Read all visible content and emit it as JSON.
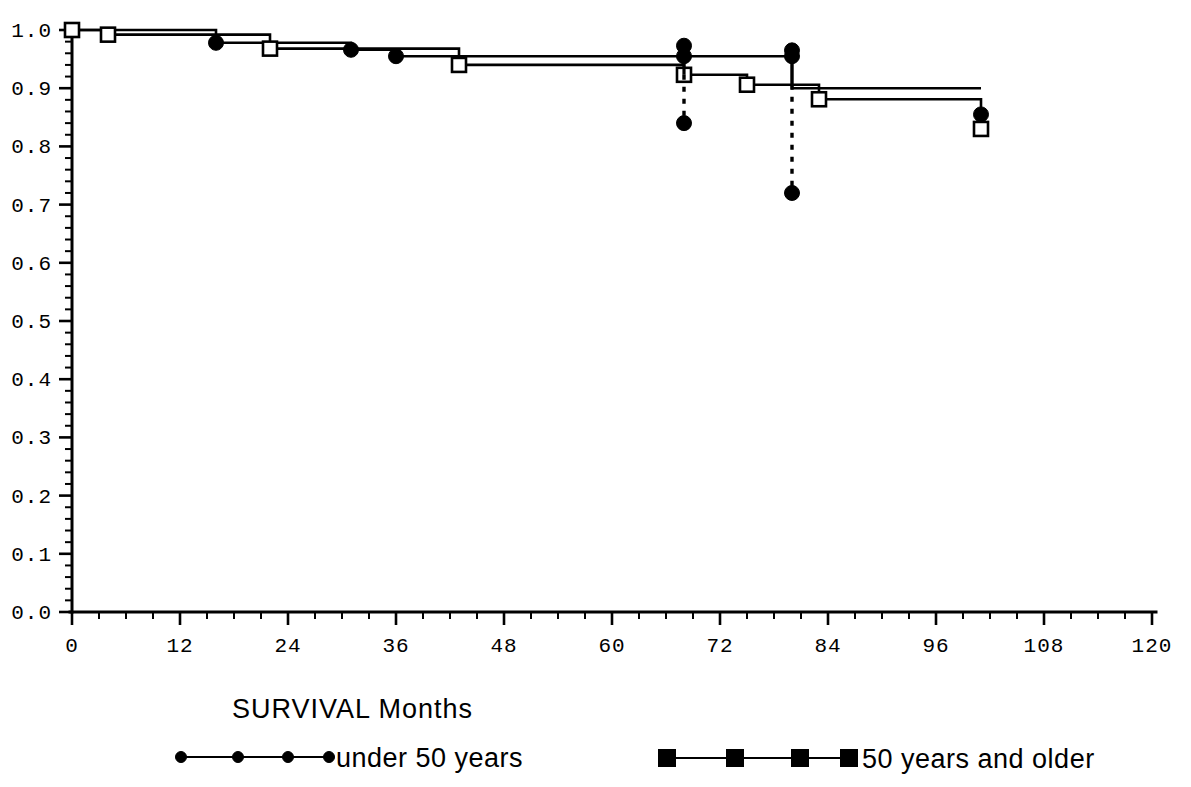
{
  "chart_data": {
    "type": "line",
    "title": "SURVIVAL  Months",
    "xlabel": "",
    "ylabel": "",
    "xlim": [
      0,
      120
    ],
    "ylim": [
      0.0,
      1.0
    ],
    "grid": false,
    "legend_position": "bottom",
    "x_ticks": [
      0,
      12,
      24,
      36,
      48,
      60,
      72,
      84,
      96,
      108,
      120
    ],
    "x_tick_labels": [
      "0",
      "12",
      "24",
      "36",
      "48",
      "60",
      "72",
      "84",
      "96",
      "108",
      "120"
    ],
    "x_minor_interval": 3,
    "y_ticks": [
      0.0,
      0.1,
      0.2,
      0.3,
      0.4,
      0.5,
      0.6,
      0.7,
      0.8,
      0.9,
      1.0
    ],
    "y_tick_labels": [
      "0.0",
      "0.1",
      "0.2",
      "0.3",
      "0.4",
      "0.5",
      "0.6",
      "0.7",
      "0.8",
      "0.9",
      "1.0"
    ],
    "y_minor_interval": 0.02,
    "series": [
      {
        "name": "under 50 years",
        "marker": "filled-circle",
        "steps": [
          {
            "x": 0,
            "y": 1.0
          },
          {
            "x": 16,
            "y": 1.0
          },
          {
            "x": 16,
            "y": 0.978
          },
          {
            "x": 31,
            "y": 0.978
          },
          {
            "x": 31,
            "y": 0.966
          },
          {
            "x": 36,
            "y": 0.966
          },
          {
            "x": 36,
            "y": 0.955
          },
          {
            "x": 68,
            "y": 0.955
          },
          {
            "x": 68,
            "y": 0.955
          },
          {
            "x": 80,
            "y": 0.955
          },
          {
            "x": 80,
            "y": 0.9
          },
          {
            "x": 101,
            "y": 0.9
          }
        ],
        "marker_points": [
          {
            "x": 0,
            "y": 1.0
          },
          {
            "x": 16,
            "y": 0.978
          },
          {
            "x": 31,
            "y": 0.966
          },
          {
            "x": 36,
            "y": 0.955
          },
          {
            "x": 68,
            "y": 0.955
          },
          {
            "x": 80,
            "y": 0.955
          },
          {
            "x": 101,
            "y": 0.855
          }
        ]
      },
      {
        "name": "50 years and older",
        "marker": "open-square",
        "steps": [
          {
            "x": 0,
            "y": 1.0
          },
          {
            "x": 4,
            "y": 1.0
          },
          {
            "x": 4,
            "y": 0.992
          },
          {
            "x": 22,
            "y": 0.992
          },
          {
            "x": 22,
            "y": 0.968
          },
          {
            "x": 43,
            "y": 0.968
          },
          {
            "x": 43,
            "y": 0.94
          },
          {
            "x": 68,
            "y": 0.94
          },
          {
            "x": 68,
            "y": 0.923
          },
          {
            "x": 75,
            "y": 0.923
          },
          {
            "x": 75,
            "y": 0.906
          },
          {
            "x": 83,
            "y": 0.906
          },
          {
            "x": 83,
            "y": 0.881
          },
          {
            "x": 101,
            "y": 0.881
          },
          {
            "x": 101,
            "y": 0.83
          }
        ],
        "marker_points": [
          {
            "x": 0,
            "y": 1.0
          },
          {
            "x": 4,
            "y": 0.992
          },
          {
            "x": 22,
            "y": 0.968
          },
          {
            "x": 43,
            "y": 0.94
          },
          {
            "x": 68,
            "y": 0.923
          },
          {
            "x": 75,
            "y": 0.906
          },
          {
            "x": 83,
            "y": 0.881
          },
          {
            "x": 101,
            "y": 0.83
          }
        ]
      }
    ],
    "error_bars": [
      {
        "x": 68,
        "upper": 0.973,
        "lower": 0.84,
        "center": 0.923,
        "style": "dashed"
      },
      {
        "x": 80,
        "upper": 0.965,
        "lower": 0.72,
        "center": 0.906,
        "style": "dashed"
      }
    ]
  },
  "legend": {
    "title": "SURVIVAL  Months",
    "entries": [
      {
        "label": "under 50 years",
        "marker": "filled-circle-small"
      },
      {
        "label": "50 years and older",
        "marker": "filled-square-large"
      }
    ]
  }
}
